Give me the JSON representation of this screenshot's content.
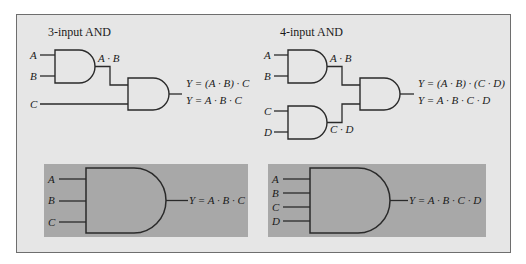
{
  "colors": {
    "page_background": "#ffffff",
    "panel_background": "#e6e6e6",
    "panel_border": "#6e6e6e",
    "symbol_box_background": "#a8a8a8",
    "line_color": "#2a2a2a"
  },
  "left_diagram": {
    "title": "3-input AND",
    "inputs": [
      "A",
      "B",
      "C"
    ],
    "intermediate_label": "A · B",
    "output_equations": [
      "Y = (A · B) · C",
      "Y = A · B · C"
    ]
  },
  "right_diagram": {
    "title": "4-input AND",
    "inputs": [
      "A",
      "B",
      "C",
      "D"
    ],
    "intermediate_labels": [
      "A · B",
      "C · D"
    ],
    "output_equations": [
      "Y = (A · B) · (C · D)",
      "Y = A · B · C · D"
    ]
  },
  "left_symbol": {
    "inputs": [
      "A",
      "B",
      "C"
    ],
    "output_equation": "Y = A · B · C"
  },
  "right_symbol": {
    "inputs": [
      "A",
      "B",
      "C",
      "D"
    ],
    "output_equation": "Y = A · B · C · D"
  }
}
